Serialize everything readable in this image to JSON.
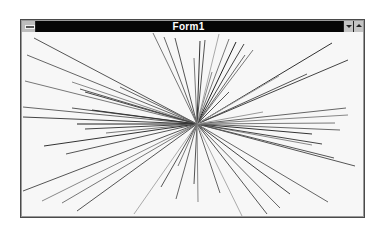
{
  "window": {
    "title": "Form1",
    "system_menu_icon": "system-menu-icon",
    "minimize_icon": "triangle-down-icon",
    "maximize_icon": "triangle-up-icon"
  },
  "canvas": {
    "background": "#f7f7f7",
    "center": [
      175,
      92
    ],
    "lines": [
      {
        "x": 12,
        "y": 6,
        "c": "#555"
      },
      {
        "x": 5,
        "y": 23,
        "c": "#666"
      },
      {
        "x": 3,
        "y": 49,
        "c": "#777"
      },
      {
        "x": 50,
        "y": 50,
        "c": "#888"
      },
      {
        "x": 58,
        "y": 57,
        "c": "#555"
      },
      {
        "x": 63,
        "y": 60,
        "c": "#444"
      },
      {
        "x": 1,
        "y": 75,
        "c": "#666"
      },
      {
        "x": 50,
        "y": 76,
        "c": "#555"
      },
      {
        "x": 70,
        "y": 78,
        "c": "#333"
      },
      {
        "x": 1,
        "y": 85,
        "c": "#444"
      },
      {
        "x": 55,
        "y": 92,
        "c": "#222"
      },
      {
        "x": 63,
        "y": 97,
        "c": "#444"
      },
      {
        "x": 84,
        "y": 101,
        "c": "#777"
      },
      {
        "x": 22,
        "y": 114,
        "c": "#333"
      },
      {
        "x": 44,
        "y": 122,
        "c": "#555"
      },
      {
        "x": 1,
        "y": 159,
        "c": "#555"
      },
      {
        "x": 20,
        "y": 169,
        "c": "#888"
      },
      {
        "x": 40,
        "y": 171,
        "c": "#777"
      },
      {
        "x": 55,
        "y": 179,
        "c": "#555"
      },
      {
        "x": 112,
        "y": 182,
        "c": "#aaa"
      },
      {
        "x": 139,
        "y": 155,
        "c": "#555"
      },
      {
        "x": 154,
        "y": 167,
        "c": "#666"
      },
      {
        "x": 156,
        "y": 134,
        "c": "#777"
      },
      {
        "x": 172,
        "y": 152,
        "c": "#555"
      },
      {
        "x": 176,
        "y": 170,
        "c": "#888"
      },
      {
        "x": 198,
        "y": 161,
        "c": "#666"
      },
      {
        "x": 220,
        "y": 184,
        "c": "#aaa"
      },
      {
        "x": 245,
        "y": 182,
        "c": "#555"
      },
      {
        "x": 268,
        "y": 162,
        "c": "#444"
      },
      {
        "x": 258,
        "y": 176,
        "c": "#666"
      },
      {
        "x": 306,
        "y": 170,
        "c": "#666"
      },
      {
        "x": 333,
        "y": 134,
        "c": "#555"
      },
      {
        "x": 290,
        "y": 113,
        "c": "#888"
      },
      {
        "x": 312,
        "y": 126,
        "c": "#555"
      },
      {
        "x": 300,
        "y": 112,
        "c": "#444"
      },
      {
        "x": 290,
        "y": 102,
        "c": "#333"
      },
      {
        "x": 313,
        "y": 91,
        "c": "#777"
      },
      {
        "x": 318,
        "y": 98,
        "c": "#666"
      },
      {
        "x": 326,
        "y": 83,
        "c": "#888"
      },
      {
        "x": 324,
        "y": 76,
        "c": "#666"
      },
      {
        "x": 285,
        "y": 42,
        "c": "#555"
      },
      {
        "x": 326,
        "y": 28,
        "c": "#444"
      },
      {
        "x": 310,
        "y": 11,
        "c": "#333"
      },
      {
        "x": 257,
        "y": 44,
        "c": "#999"
      },
      {
        "x": 231,
        "y": 18,
        "c": "#777"
      },
      {
        "x": 223,
        "y": 23,
        "c": "#666"
      },
      {
        "x": 222,
        "y": 12,
        "c": "#444"
      },
      {
        "x": 214,
        "y": 10,
        "c": "#222"
      },
      {
        "x": 207,
        "y": 7,
        "c": "#777"
      },
      {
        "x": 197,
        "y": 2,
        "c": "#aaa"
      },
      {
        "x": 183,
        "y": 8,
        "c": "#555"
      },
      {
        "x": 178,
        "y": 9,
        "c": "#333"
      },
      {
        "x": 172,
        "y": 26,
        "c": "#777"
      },
      {
        "x": 153,
        "y": 6,
        "c": "#555"
      },
      {
        "x": 142,
        "y": 5,
        "c": "#666"
      },
      {
        "x": 131,
        "y": 1,
        "c": "#777"
      },
      {
        "x": 190,
        "y": 40,
        "c": "#888"
      },
      {
        "x": 207,
        "y": 60,
        "c": "#555"
      },
      {
        "x": 241,
        "y": 80,
        "c": "#999"
      },
      {
        "x": 98,
        "y": 55,
        "c": "#666"
      }
    ]
  }
}
